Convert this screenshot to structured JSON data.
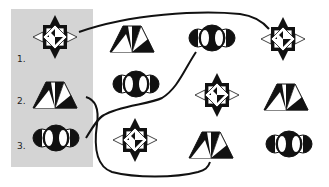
{
  "puzzle": {
    "reference_labels": [
      "1.",
      "2.",
      "3."
    ],
    "reference_figures": [
      {
        "id": 1,
        "type": "star-square"
      },
      {
        "id": 2,
        "type": "trapezoid"
      },
      {
        "id": 3,
        "type": "circles"
      }
    ],
    "grid": [
      [
        "trapezoid",
        "circles",
        "star-square"
      ],
      [
        "circles",
        "star-square",
        "trapezoid"
      ],
      [
        "star-square",
        "trapezoid",
        "circles"
      ]
    ],
    "connections": [
      {
        "from": "reference-1",
        "to": "grid-row1-col3"
      },
      {
        "from": "reference-2",
        "to": "grid-row3-col2"
      },
      {
        "from": "reference-3",
        "to": "grid-row1-col2"
      }
    ],
    "colors": {
      "panel": "#d4d4d4",
      "ink": "#111111",
      "paper": "#ffffff"
    }
  }
}
